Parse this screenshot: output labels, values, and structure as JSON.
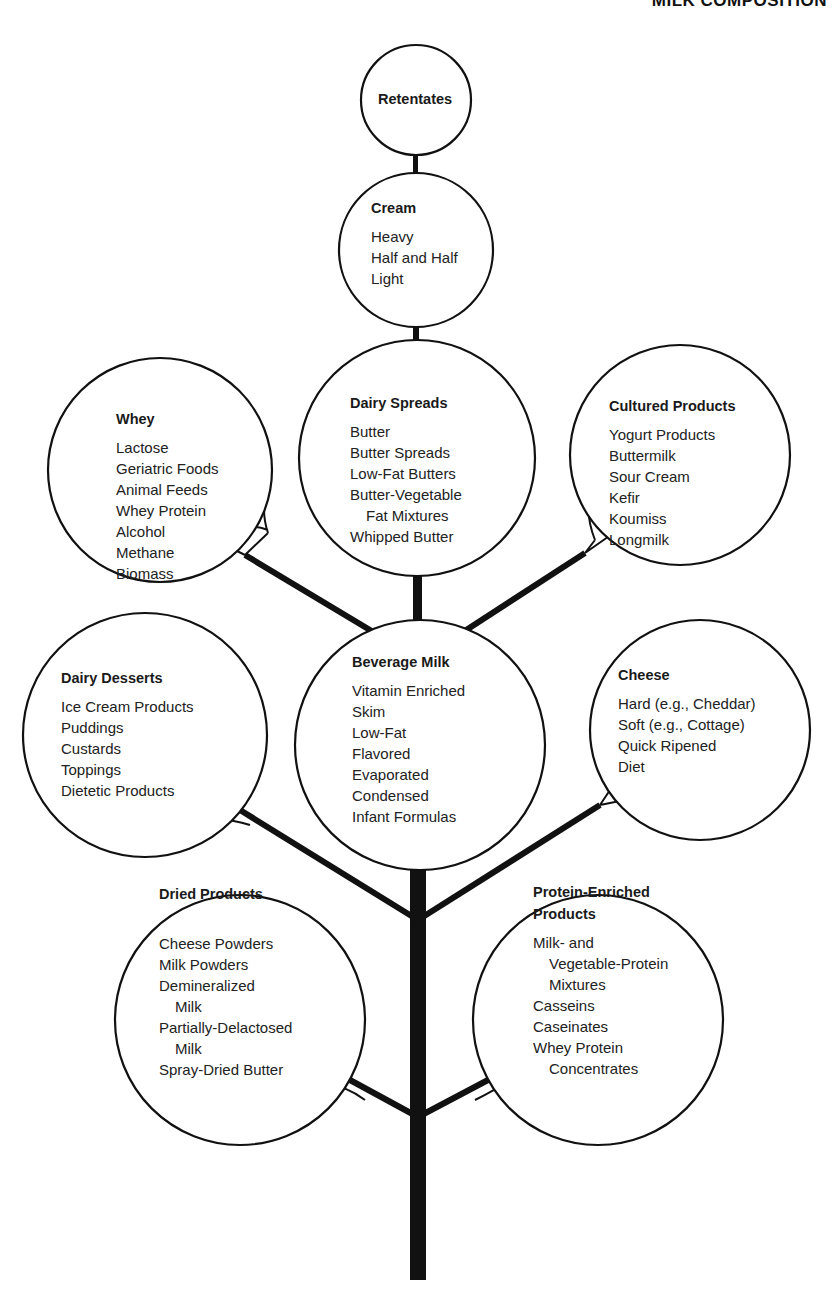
{
  "header": {
    "title": "MILK COMPOSITION"
  },
  "colors": {
    "ink": "#111111",
    "background": "#ffffff"
  },
  "nodes": [
    {
      "id": "retentates",
      "title": "Retentates",
      "cx": 416,
      "cy": 100,
      "r": 55,
      "tx": 378,
      "ty": 104,
      "items": []
    },
    {
      "id": "cream",
      "title": "Cream",
      "cx": 416,
      "cy": 250,
      "r": 77,
      "tx": 371,
      "ty": 213,
      "items": [
        "Heavy",
        "Half and Half",
        "Light"
      ]
    },
    {
      "id": "dairy-spreads",
      "title": "Dairy Spreads",
      "cx": 417,
      "cy": 458,
      "r": 118,
      "tx": 350,
      "ty": 408,
      "items": [
        "Butter",
        "Butter Spreads",
        "Low-Fat Butters",
        "Butter-Vegetable",
        "   Fat Mixtures",
        "Whipped Butter"
      ]
    },
    {
      "id": "whey",
      "title": "Whey",
      "cx": 160,
      "cy": 470,
      "r": 112,
      "tx": 116,
      "ty": 424,
      "items": [
        "Lactose",
        "Geriatric Foods",
        "Animal Feeds",
        "Whey Protein",
        "Alcohol",
        "Methane",
        "Biomass"
      ]
    },
    {
      "id": "cultured-products",
      "title": "Cultured Products",
      "cx": 680,
      "cy": 455,
      "r": 110,
      "tx": 609,
      "ty": 411,
      "items": [
        "Yogurt Products",
        "Buttermilk",
        "Sour Cream",
        "Kefir",
        "Koumiss",
        "Longmilk"
      ]
    },
    {
      "id": "beverage-milk",
      "title": "Beverage Milk",
      "cx": 420,
      "cy": 745,
      "r": 125,
      "tx": 352,
      "ty": 667,
      "items": [
        "Vitamin Enriched",
        "Skim",
        "Low-Fat",
        "Flavored",
        "Evaporated",
        "Condensed",
        "Infant Formulas"
      ]
    },
    {
      "id": "dairy-desserts",
      "title": "Dairy Desserts",
      "cx": 145,
      "cy": 735,
      "r": 122,
      "tx": 61,
      "ty": 683,
      "items": [
        "Ice Cream Products",
        "Puddings",
        "Custards",
        "Toppings",
        "Dietetic Products"
      ]
    },
    {
      "id": "cheese",
      "title": "Cheese",
      "cx": 700,
      "cy": 730,
      "r": 110,
      "tx": 618,
      "ty": 680,
      "items": [
        "Hard (e.g., Cheddar)",
        "Soft (e.g., Cottage)",
        "Quick Ripened",
        "Diet"
      ]
    },
    {
      "id": "dried-products",
      "title": "Dried Products",
      "cx": 240,
      "cy": 1020,
      "r": 125,
      "tx": 159,
      "ty": 899,
      "items": [
        "",
        "Cheese Powders",
        "Milk Powders",
        "Demineralized",
        "   Milk",
        "Partially-Delactosed",
        "   Milk",
        "Spray-Dried Butter"
      ]
    },
    {
      "id": "protein-enriched-products",
      "title": "Protein-Enriched",
      "title2": "Products",
      "cx": 598,
      "cy": 1020,
      "r": 125,
      "tx": 533,
      "ty": 897,
      "items": [
        "Milk- and",
        "   Vegetable-Protein",
        "   Mixtures",
        "Casseins",
        "Caseinates",
        "Whey Protein",
        "   Concentrates"
      ]
    }
  ]
}
